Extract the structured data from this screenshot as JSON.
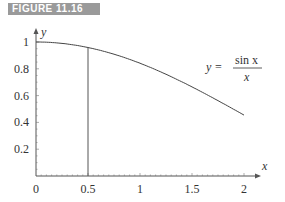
{
  "figure_label": "FIGURE 11.16",
  "chart_data": {
    "type": "line",
    "title": "",
    "xlabel": "x",
    "ylabel": "y",
    "xlim": [
      0,
      2
    ],
    "ylim": [
      0,
      1
    ],
    "x_ticks": [
      "0",
      "0.5",
      "1",
      "1.5",
      "2"
    ],
    "y_ticks": [
      "0.2",
      "0.4",
      "0.6",
      "0.8",
      "1"
    ],
    "series": [
      {
        "name": "sin x / x",
        "function": "sin(x)/x",
        "x": [
          0,
          0.25,
          0.5,
          0.75,
          1,
          1.25,
          1.5,
          1.75,
          2
        ],
        "values": [
          1,
          0.9896,
          0.9589,
          0.9089,
          0.8415,
          0.7592,
          0.665,
          0.5623,
          0.4546
        ]
      }
    ],
    "annotations": [
      {
        "type": "vertical-line",
        "x": 0.5,
        "label": ""
      },
      {
        "type": "equation",
        "lhs": "y =",
        "numerator": "sin x",
        "denominator": "x"
      }
    ],
    "grid": false,
    "legend": "none"
  }
}
